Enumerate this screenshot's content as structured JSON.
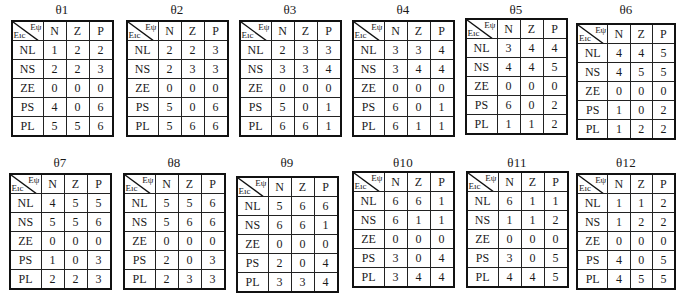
{
  "figure": {
    "background_color": "#ffffff",
    "ink_color": "#1a1a1a",
    "corner_header": {
      "column_label": "Eψ",
      "row_label": "Eıc"
    },
    "column_headers": [
      "N",
      "Z",
      "P"
    ],
    "row_headers": [
      "NL",
      "NS",
      "ZE",
      "PS",
      "PL"
    ],
    "rows_layout": [
      [
        "t1",
        "t2",
        "t3",
        "t4",
        "t5",
        "t6"
      ],
      [
        "t7",
        "t8",
        "t9",
        "t10",
        "t11",
        "t12"
      ]
    ]
  },
  "tables": {
    "t1": {
      "title": "θ1",
      "values": [
        [
          "1",
          "2",
          "2"
        ],
        [
          "2",
          "2",
          "3"
        ],
        [
          "0",
          "0",
          "0"
        ],
        [
          "4",
          "0",
          "6"
        ],
        [
          "5",
          "5",
          "6"
        ]
      ]
    },
    "t2": {
      "title": "θ2",
      "values": [
        [
          "2",
          "2",
          "3"
        ],
        [
          "2",
          "3",
          "3"
        ],
        [
          "0",
          "0",
          "0"
        ],
        [
          "5",
          "0",
          "6"
        ],
        [
          "5",
          "6",
          "6"
        ]
      ]
    },
    "t3": {
      "title": "θ3",
      "values": [
        [
          "2",
          "3",
          "3"
        ],
        [
          "3",
          "3",
          "4"
        ],
        [
          "0",
          "0",
          "0"
        ],
        [
          "5",
          "0",
          "1"
        ],
        [
          "6",
          "6",
          "1"
        ]
      ]
    },
    "t4": {
      "title": "θ4",
      "values": [
        [
          "3",
          "3",
          "4"
        ],
        [
          "3",
          "4",
          "4"
        ],
        [
          "0",
          "0",
          "0"
        ],
        [
          "6",
          "0",
          "1"
        ],
        [
          "6",
          "1",
          "1"
        ]
      ]
    },
    "t5": {
      "title": "θ5",
      "values": [
        [
          "3",
          "4",
          "4"
        ],
        [
          "4",
          "4",
          "5"
        ],
        [
          "0",
          "0",
          "0"
        ],
        [
          "6",
          "0",
          "2"
        ],
        [
          "1",
          "1",
          "2"
        ]
      ]
    },
    "t6": {
      "title": "θ6",
      "values": [
        [
          "4",
          "4",
          "5"
        ],
        [
          "4",
          "5",
          "5"
        ],
        [
          "0",
          "0",
          "0"
        ],
        [
          "1",
          "0",
          "2"
        ],
        [
          "1",
          "2",
          "2"
        ]
      ]
    },
    "t7": {
      "title": "θ7",
      "values": [
        [
          "4",
          "5",
          "5"
        ],
        [
          "5",
          "5",
          "6"
        ],
        [
          "0",
          "0",
          "0"
        ],
        [
          "1",
          "0",
          "3"
        ],
        [
          "2",
          "2",
          "3"
        ]
      ]
    },
    "t8": {
      "title": "θ8",
      "values": [
        [
          "5",
          "5",
          "6"
        ],
        [
          "5",
          "6",
          "6"
        ],
        [
          "0",
          "0",
          "0"
        ],
        [
          "2",
          "0",
          "3"
        ],
        [
          "2",
          "3",
          "3"
        ]
      ]
    },
    "t9": {
      "title": "θ9",
      "values": [
        [
          "5",
          "6",
          "6"
        ],
        [
          "6",
          "6",
          "1"
        ],
        [
          "0",
          "0",
          "0"
        ],
        [
          "2",
          "0",
          "4"
        ],
        [
          "3",
          "3",
          "4"
        ]
      ]
    },
    "t10": {
      "title": "θ10",
      "values": [
        [
          "6",
          "6",
          "1"
        ],
        [
          "6",
          "1",
          "1"
        ],
        [
          "0",
          "0",
          "0"
        ],
        [
          "3",
          "0",
          "4"
        ],
        [
          "3",
          "4",
          "4"
        ]
      ]
    },
    "t11": {
      "title": "θ11",
      "values": [
        [
          "6",
          "1",
          "1"
        ],
        [
          "1",
          "1",
          "2"
        ],
        [
          "0",
          "0",
          "0"
        ],
        [
          "3",
          "0",
          "5"
        ],
        [
          "4",
          "4",
          "5"
        ]
      ]
    },
    "t12": {
      "title": "θ12",
      "values": [
        [
          "1",
          "1",
          "2"
        ],
        [
          "1",
          "2",
          "2"
        ],
        [
          "0",
          "0",
          "0"
        ],
        [
          "4",
          "0",
          "5"
        ],
        [
          "4",
          "5",
          "5"
        ]
      ]
    }
  }
}
